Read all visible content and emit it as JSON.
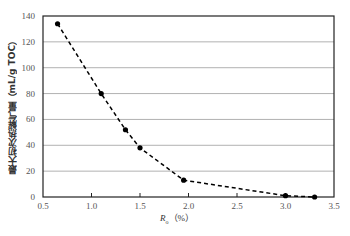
{
  "chart_data": {
    "type": "line",
    "title": "",
    "xlabel": "Ro (%)",
    "xlabel_main": "R",
    "xlabel_sub": "o",
    "xlabel_unit": "（%）",
    "ylabel": "最大初次热解气量（mL/g TOC）",
    "xlim": [
      0.5,
      3.5
    ],
    "ylim": [
      0,
      140
    ],
    "xticks": [
      "0.5",
      "1.0",
      "1.5",
      "2.0",
      "2.5",
      "3.0",
      "3.5"
    ],
    "yticks": [
      "0",
      "20",
      "40",
      "60",
      "80",
      "100",
      "120",
      "140"
    ],
    "grid": "horizontal",
    "legend": "none",
    "series": [
      {
        "name": "最大初次热解气量",
        "line_style": "dashed",
        "marker": "circle",
        "color": "#000000",
        "x": [
          0.65,
          1.1,
          1.35,
          1.5,
          1.95,
          3.0,
          3.3
        ],
        "y": [
          134,
          80,
          52,
          38,
          13,
          1,
          0
        ]
      }
    ]
  }
}
